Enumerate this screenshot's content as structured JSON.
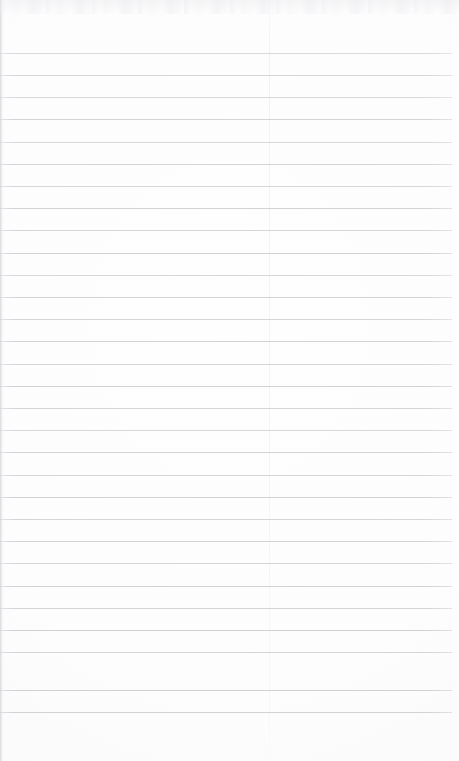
{
  "document": {
    "kind": "scanned-ruled-paper",
    "orientation": "portrait",
    "width_px": 459,
    "height_px": 761,
    "visible_text": "",
    "has_handwriting": false,
    "has_print": false,
    "description": "Blank scanned ruled notebook page with no writing"
  },
  "colors": {
    "paper": "#fdfdfd",
    "paper_edge_tint": "#f7f7f9",
    "rule_line": "#c9c9cf",
    "margin_rule": "#e6e6ec",
    "scan_noise": "#ececf0"
  },
  "ruling": {
    "line_count": 30,
    "first_line_y": 53,
    "last_line_y": 712,
    "line_spacing_px": 22.2,
    "line_thickness_px": 1,
    "line_start_x": 0,
    "line_end_x": 452,
    "top_margin_px": 53,
    "bottom_margin_px": 49,
    "right_margin_px": 7,
    "lines": [
      {
        "y": 53,
        "x1": 0,
        "x2": 452,
        "opacity": 0.7
      },
      {
        "y": 75,
        "x1": 0,
        "x2": 452,
        "opacity": 0.78
      },
      {
        "y": 97,
        "x1": 0,
        "x2": 452,
        "opacity": 0.72
      },
      {
        "y": 119,
        "x1": 0,
        "x2": 452,
        "opacity": 0.8
      },
      {
        "y": 142,
        "x1": 0,
        "x2": 452,
        "opacity": 0.74
      },
      {
        "y": 164,
        "x1": 0,
        "x2": 452,
        "opacity": 0.82
      },
      {
        "y": 186,
        "x1": 0,
        "x2": 452,
        "opacity": 0.76
      },
      {
        "y": 208,
        "x1": 0,
        "x2": 452,
        "opacity": 0.84
      },
      {
        "y": 230,
        "x1": 0,
        "x2": 452,
        "opacity": 0.78
      },
      {
        "y": 253,
        "x1": 0,
        "x2": 452,
        "opacity": 0.86
      },
      {
        "y": 275,
        "x1": 0,
        "x2": 452,
        "opacity": 0.74
      },
      {
        "y": 297,
        "x1": 0,
        "x2": 452,
        "opacity": 0.82
      },
      {
        "y": 319,
        "x1": 0,
        "x2": 452,
        "opacity": 0.76
      },
      {
        "y": 341,
        "x1": 0,
        "x2": 452,
        "opacity": 0.84
      },
      {
        "y": 364,
        "x1": 0,
        "x2": 452,
        "opacity": 0.78
      },
      {
        "y": 386,
        "x1": 0,
        "x2": 452,
        "opacity": 0.86
      },
      {
        "y": 408,
        "x1": 0,
        "x2": 452,
        "opacity": 0.8
      },
      {
        "y": 430,
        "x1": 0,
        "x2": 452,
        "opacity": 0.74
      },
      {
        "y": 452,
        "x1": 0,
        "x2": 452,
        "opacity": 0.84
      },
      {
        "y": 475,
        "x1": 0,
        "x2": 452,
        "opacity": 0.78
      },
      {
        "y": 497,
        "x1": 0,
        "x2": 452,
        "opacity": 0.86
      },
      {
        "y": 519,
        "x1": 0,
        "x2": 452,
        "opacity": 0.76
      },
      {
        "y": 541,
        "x1": 0,
        "x2": 452,
        "opacity": 0.82
      },
      {
        "y": 563,
        "x1": 0,
        "x2": 452,
        "opacity": 0.78
      },
      {
        "y": 586,
        "x1": 0,
        "x2": 452,
        "opacity": 0.86
      },
      {
        "y": 608,
        "x1": 0,
        "x2": 452,
        "opacity": 0.8
      },
      {
        "y": 630,
        "x1": 0,
        "x2": 452,
        "opacity": 0.88
      },
      {
        "y": 652,
        "x1": 0,
        "x2": 452,
        "opacity": 0.82
      },
      {
        "y": 690,
        "x1": 0,
        "x2": 452,
        "opacity": 0.88
      },
      {
        "y": 712,
        "x1": 0,
        "x2": 452,
        "opacity": 0.84
      }
    ],
    "margin_rules": [
      {
        "x": 269,
        "opacity": 0.55
      }
    ]
  }
}
